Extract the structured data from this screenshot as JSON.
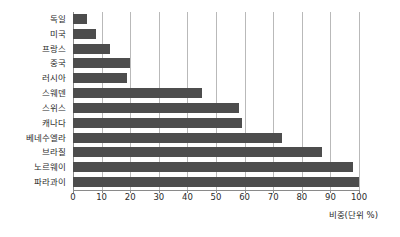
{
  "chart_data": {
    "type": "bar",
    "orientation": "horizontal",
    "title": "",
    "xlabel": "비중(단위 %)",
    "ylabel": "",
    "xlim": [
      0,
      100
    ],
    "xticks": [
      0,
      10,
      20,
      30,
      40,
      50,
      60,
      70,
      80,
      90,
      100
    ],
    "grid": true,
    "legend": false,
    "bar_color": "#4d4d4d",
    "categories": [
      "독일",
      "미국",
      "프랑스",
      "중국",
      "러시아",
      "스웨덴",
      "스위스",
      "캐나다",
      "베네수엘라",
      "브라질",
      "노르웨이",
      "파라과이"
    ],
    "values": [
      5,
      8,
      13,
      20,
      19,
      45,
      58,
      59,
      73,
      87,
      98,
      100
    ]
  }
}
